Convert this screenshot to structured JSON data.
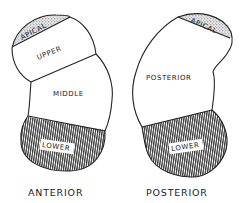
{
  "diagram": {
    "anterior": {
      "caption": "ANTERIOR",
      "segments": {
        "apical": "APICAL",
        "upper": "UPPER",
        "middle": "MIDDLE",
        "lower": "LOWER"
      }
    },
    "posterior": {
      "caption": "POSTERIOR",
      "segments": {
        "apical": "APICAL",
        "posterior": "POSTERIOR",
        "lower": "LOWER"
      }
    },
    "colors": {
      "stroke": "#222222",
      "stipple": "#9a9a9a",
      "hatch": "#333333",
      "background": "#ffffff"
    }
  }
}
